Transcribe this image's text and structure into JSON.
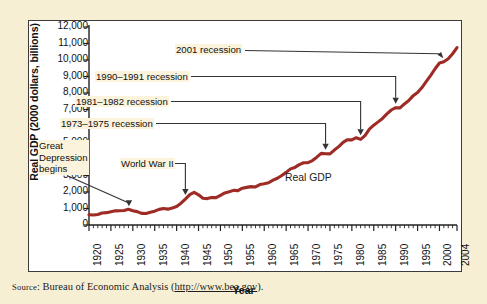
{
  "figure": {
    "source_prefix": "Source",
    "source_text": ": Bureau of Economic Analysis (",
    "source_url": "http://www.bea.gov",
    "source_suffix": ")."
  },
  "chart_data": {
    "type": "line",
    "title": "",
    "xlabel": "Year",
    "ylabel": "Real GDP (2000 dollars, billions)",
    "xlim": [
      1920,
      2004
    ],
    "ylim": [
      0,
      12000
    ],
    "grid": false,
    "legend": "inline",
    "series_label": "Real GDP",
    "line_color": "#9e2b25",
    "y_ticks": [
      "0",
      "1,000",
      "2,000",
      "3,000",
      "4,000",
      "5,000",
      "6,000",
      "7,000",
      "8,000",
      "9,000",
      "10,000",
      "11,000",
      "12,000"
    ],
    "y_tick_values": [
      0,
      1000,
      2000,
      3000,
      4000,
      5000,
      6000,
      7000,
      8000,
      9000,
      10000,
      11000,
      12000
    ],
    "x_ticks": [
      "1920",
      "1925",
      "1930",
      "1935",
      "1940",
      "1945",
      "1950",
      "1955",
      "1960",
      "1965",
      "1970",
      "1975",
      "1980",
      "1985",
      "1990",
      "1995",
      "2000",
      "2004"
    ],
    "x_tick_values": [
      1920,
      1925,
      1930,
      1935,
      1940,
      1945,
      1950,
      1955,
      1960,
      1965,
      1970,
      1975,
      1980,
      1985,
      1990,
      1995,
      2000,
      2004
    ],
    "x": [
      1920,
      1921,
      1922,
      1923,
      1924,
      1925,
      1926,
      1927,
      1928,
      1929,
      1930,
      1931,
      1932,
      1933,
      1934,
      1935,
      1936,
      1937,
      1938,
      1939,
      1940,
      1941,
      1942,
      1943,
      1944,
      1945,
      1946,
      1947,
      1948,
      1949,
      1950,
      1951,
      1952,
      1953,
      1954,
      1955,
      1956,
      1957,
      1958,
      1959,
      1960,
      1961,
      1962,
      1963,
      1964,
      1965,
      1966,
      1967,
      1968,
      1969,
      1970,
      1971,
      1972,
      1973,
      1974,
      1975,
      1976,
      1977,
      1978,
      1979,
      1980,
      1981,
      1982,
      1983,
      1984,
      1985,
      1986,
      1987,
      1988,
      1989,
      1990,
      1991,
      1992,
      1993,
      1994,
      1995,
      1996,
      1997,
      1998,
      1999,
      2000,
      2001,
      2002,
      2003,
      2004
    ],
    "values": [
      620,
      605,
      640,
      725,
      748,
      805,
      858,
      868,
      878,
      950,
      866,
      810,
      705,
      695,
      770,
      838,
      948,
      996,
      960,
      1036,
      1120,
      1320,
      1570,
      1840,
      1980,
      1830,
      1620,
      1600,
      1670,
      1660,
      1800,
      1940,
      2010,
      2100,
      2085,
      2230,
      2280,
      2325,
      2305,
      2450,
      2500,
      2560,
      2715,
      2835,
      3000,
      3190,
      3400,
      3490,
      3660,
      3775,
      3780,
      3905,
      4110,
      4340,
      4320,
      4310,
      4540,
      4750,
      5010,
      5170,
      5160,
      5290,
      5190,
      5420,
      5810,
      6050,
      6250,
      6460,
      6730,
      6970,
      7110,
      7100,
      7340,
      7540,
      7840,
      8030,
      8330,
      8700,
      9070,
      9470,
      9820,
      9890,
      10070,
      10380,
      10750
    ],
    "annotations": [
      {
        "name": "great-depression",
        "text": "Great\nDepression\nbegins",
        "lines": [
          "Great",
          "Depression",
          "begins"
        ],
        "target_year": 1929,
        "target_value": 950
      },
      {
        "name": "world-war-ii",
        "text": "World War II",
        "lines": [
          "World War II"
        ],
        "target_year": 1942,
        "target_value": 1570
      },
      {
        "name": "recession-1973-1975",
        "text": "1973–1975 recession",
        "lines": [
          "1973–1975 recession"
        ],
        "target_year": 1974,
        "target_value": 4320
      },
      {
        "name": "recession-1981-1982",
        "text": "1981–1982 recession",
        "lines": [
          "1981–1982 recession"
        ],
        "target_year": 1982,
        "target_value": 5190
      },
      {
        "name": "recession-1990-1991",
        "text": "1990–1991 recession",
        "lines": [
          "1990–1991 recession"
        ],
        "target_year": 1990,
        "target_value": 7110
      },
      {
        "name": "recession-2001",
        "text": "2001 recession",
        "lines": [
          "2001 recession"
        ],
        "target_year": 2001,
        "target_value": 9890
      }
    ]
  }
}
